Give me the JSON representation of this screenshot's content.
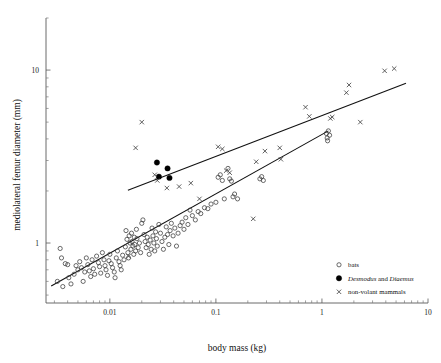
{
  "chart_data": {
    "type": "scatter",
    "title": "",
    "xlabel": "body mass (kg)",
    "ylabel": "mediolateral femur diameter (mm)",
    "xscale": "log",
    "yscale": "log",
    "xlim": [
      0.0025,
      10
    ],
    "ylim": [
      0.45,
      20
    ],
    "grid": false,
    "xticks": [
      0.01,
      0.1,
      1,
      10
    ],
    "xticklabels": [
      "0.01",
      "0.1",
      "1",
      "10"
    ],
    "yticks": [
      1,
      10
    ],
    "yticklabels": [
      "1",
      "10"
    ],
    "legend_position": "bottom-right",
    "legend": [
      {
        "key": "bats",
        "label": "bats",
        "marker": "open-circle",
        "italic": false
      },
      {
        "key": "desmodus",
        "label": "Desmodus and Diaemus",
        "marker": "filled-circle",
        "italic": true,
        "label_prefix": "",
        "italic_words": [
          "Desmodus",
          "Diaemus"
        ],
        "plain_words": [
          "and"
        ]
      },
      {
        "key": "nonvolant",
        "label": "non-volant mammals",
        "marker": "cross",
        "italic": false
      }
    ],
    "series": [
      {
        "name": "bats",
        "marker": "open-circle",
        "color": "#3a3a3a",
        "points": [
          [
            0.0032,
            0.6
          ],
          [
            0.0034,
            0.93
          ],
          [
            0.0035,
            0.82
          ],
          [
            0.0036,
            0.56
          ],
          [
            0.0038,
            0.76
          ],
          [
            0.004,
            0.75
          ],
          [
            0.0041,
            0.63
          ],
          [
            0.0043,
            0.58
          ],
          [
            0.0046,
            0.66
          ],
          [
            0.0048,
            0.74
          ],
          [
            0.005,
            0.7
          ],
          [
            0.0052,
            0.78
          ],
          [
            0.0054,
            0.72
          ],
          [
            0.0056,
            0.6
          ],
          [
            0.0058,
            0.68
          ],
          [
            0.006,
            0.82
          ],
          [
            0.0062,
            0.75
          ],
          [
            0.0064,
            0.69
          ],
          [
            0.0066,
            0.64
          ],
          [
            0.0068,
            0.8
          ],
          [
            0.007,
            0.71
          ],
          [
            0.0072,
            0.66
          ],
          [
            0.0075,
            0.84
          ],
          [
            0.0078,
            0.77
          ],
          [
            0.008,
            0.73
          ],
          [
            0.0082,
            0.67
          ],
          [
            0.0085,
            0.88
          ],
          [
            0.0088,
            0.8
          ],
          [
            0.009,
            0.74
          ],
          [
            0.0092,
            0.7
          ],
          [
            0.0095,
            0.65
          ],
          [
            0.0098,
            0.79
          ],
          [
            0.01,
            0.86
          ],
          [
            0.0103,
            0.76
          ],
          [
            0.0106,
            0.72
          ],
          [
            0.011,
            0.68
          ],
          [
            0.0112,
            0.63
          ],
          [
            0.0115,
            0.82
          ],
          [
            0.0118,
            0.9
          ],
          [
            0.0122,
            0.78
          ],
          [
            0.0125,
            0.74
          ],
          [
            0.0128,
            0.7
          ],
          [
            0.0132,
            0.85
          ],
          [
            0.0136,
            0.8
          ],
          [
            0.014,
            0.95
          ],
          [
            0.0142,
            1.18
          ],
          [
            0.0145,
            1.05
          ],
          [
            0.0148,
            0.88
          ],
          [
            0.015,
            0.82
          ],
          [
            0.0152,
            1.1
          ],
          [
            0.0155,
            1.0
          ],
          [
            0.0158,
            0.92
          ],
          [
            0.016,
            1.14
          ],
          [
            0.0162,
            1.02
          ],
          [
            0.0165,
            0.96
          ],
          [
            0.0168,
            0.86
          ],
          [
            0.017,
            1.08
          ],
          [
            0.0172,
            0.98
          ],
          [
            0.0175,
            0.9
          ],
          [
            0.0178,
            1.2
          ],
          [
            0.018,
            1.06
          ],
          [
            0.0185,
            0.94
          ],
          [
            0.019,
            1.0
          ],
          [
            0.0195,
            0.88
          ],
          [
            0.02,
            1.3
          ],
          [
            0.0205,
            1.36
          ],
          [
            0.021,
            1.12
          ],
          [
            0.0215,
            1.02
          ],
          [
            0.022,
            0.94
          ],
          [
            0.0225,
            1.08
          ],
          [
            0.023,
            0.98
          ],
          [
            0.0235,
            0.86
          ],
          [
            0.024,
            1.04
          ],
          [
            0.0245,
            0.92
          ],
          [
            0.025,
            1.22
          ],
          [
            0.0255,
            1.1
          ],
          [
            0.026,
            1.0
          ],
          [
            0.0265,
            0.9
          ],
          [
            0.027,
            1.16
          ],
          [
            0.0275,
            1.06
          ],
          [
            0.028,
            0.96
          ],
          [
            0.029,
            1.28
          ],
          [
            0.03,
            1.14
          ],
          [
            0.031,
            1.02
          ],
          [
            0.032,
            0.92
          ],
          [
            0.033,
            1.08
          ],
          [
            0.034,
            1.24
          ],
          [
            0.035,
            1.12
          ],
          [
            0.036,
            0.98
          ],
          [
            0.037,
            1.18
          ],
          [
            0.038,
            1.3
          ],
          [
            0.0395,
            1.1
          ],
          [
            0.041,
            1.22
          ],
          [
            0.0425,
            0.96
          ],
          [
            0.044,
            1.14
          ],
          [
            0.046,
            1.26
          ],
          [
            0.048,
            1.32
          ],
          [
            0.05,
            1.2
          ],
          [
            0.052,
            1.4
          ],
          [
            0.0545,
            1.28
          ],
          [
            0.057,
            1.55
          ],
          [
            0.06,
            1.44
          ],
          [
            0.064,
            1.36
          ],
          [
            0.068,
            1.52
          ],
          [
            0.072,
            1.48
          ],
          [
            0.078,
            1.6
          ],
          [
            0.084,
            1.58
          ],
          [
            0.09,
            1.68
          ],
          [
            0.1,
            1.72
          ],
          [
            0.105,
            2.4
          ],
          [
            0.11,
            2.48
          ],
          [
            0.115,
            2.3
          ],
          [
            0.12,
            1.8
          ],
          [
            0.13,
            2.7
          ],
          [
            0.135,
            2.35
          ],
          [
            0.14,
            2.28
          ],
          [
            0.145,
            1.85
          ],
          [
            0.15,
            1.92
          ],
          [
            0.16,
            1.8
          ],
          [
            0.26,
            2.35
          ],
          [
            0.27,
            2.42
          ],
          [
            0.28,
            2.3
          ],
          [
            1.1,
            4.3
          ],
          [
            1.12,
            4.05
          ],
          [
            1.13,
            3.9
          ],
          [
            1.15,
            4.45
          ],
          [
            1.18,
            4.2
          ]
        ]
      },
      {
        "name": "Desmodus and Diaemus",
        "marker": "filled-circle",
        "color": "#000000",
        "points": [
          [
            0.0278,
            2.92
          ],
          [
            0.029,
            2.42
          ],
          [
            0.035,
            2.7
          ],
          [
            0.0365,
            2.38
          ]
        ]
      },
      {
        "name": "non-volant mammals",
        "marker": "cross",
        "color": "#3a3a3a",
        "points": [
          [
            0.015,
            0.84
          ],
          [
            0.0175,
            3.55
          ],
          [
            0.02,
            5.0
          ],
          [
            0.0265,
            2.48
          ],
          [
            0.028,
            2.3
          ],
          [
            0.0345,
            2.08
          ],
          [
            0.045,
            2.12
          ],
          [
            0.058,
            2.22
          ],
          [
            0.07,
            1.8
          ],
          [
            0.105,
            3.6
          ],
          [
            0.115,
            3.5
          ],
          [
            0.125,
            2.62
          ],
          [
            0.135,
            2.55
          ],
          [
            0.225,
            1.38
          ],
          [
            0.24,
            2.95
          ],
          [
            0.29,
            3.4
          ],
          [
            0.4,
            3.55
          ],
          [
            0.41,
            3.05
          ],
          [
            0.7,
            6.1
          ],
          [
            0.76,
            5.4
          ],
          [
            1.2,
            5.25
          ],
          [
            1.25,
            5.35
          ],
          [
            1.7,
            7.4
          ],
          [
            1.8,
            8.2
          ],
          [
            2.3,
            5.0
          ],
          [
            3.9,
            9.9
          ],
          [
            4.8,
            10.2
          ]
        ]
      }
    ],
    "regression_lines": [
      {
        "name": "non-volant regression",
        "x_start": 0.0148,
        "y_start": 2.02,
        "x_end": 6.2,
        "y_end": 8.4
      },
      {
        "name": "bats regression",
        "x_start": 0.0028,
        "y_start": 0.565,
        "x_end": 1.15,
        "y_end": 4.45
      }
    ]
  }
}
